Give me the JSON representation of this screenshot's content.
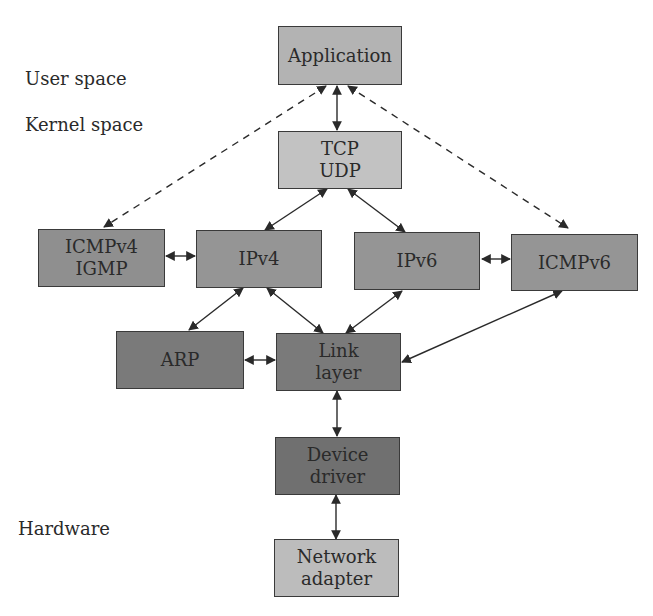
{
  "regions": {
    "user_space": "User space",
    "kernel_space": "Kernel space",
    "hardware": "Hardware"
  },
  "colors": {
    "light": "#bcbcbc",
    "medium": "#8e8e8e",
    "dark": "#767676",
    "stroke": "#2a2a2a"
  },
  "nodes": {
    "application": {
      "lines": [
        "Application"
      ]
    },
    "tcp_udp": {
      "lines": [
        "TCP",
        "UDP"
      ]
    },
    "icmpv4_igmp": {
      "lines": [
        "ICMPv4",
        "IGMP"
      ]
    },
    "ipv4": {
      "lines": [
        "IPv4"
      ]
    },
    "ipv6": {
      "lines": [
        "IPv6"
      ]
    },
    "icmpv6": {
      "lines": [
        "ICMPv6"
      ]
    },
    "arp": {
      "lines": [
        "ARP"
      ]
    },
    "link_layer": {
      "lines": [
        "Link",
        "layer"
      ]
    },
    "device_driver": {
      "lines": [
        "Device",
        "driver"
      ]
    },
    "network_adapter": {
      "lines": [
        "Network",
        "adapter"
      ]
    }
  },
  "edges": [
    {
      "from": "application",
      "to": "tcp_udp",
      "style": "solid",
      "bidirectional": true
    },
    {
      "from": "application",
      "to": "icmpv4_igmp",
      "style": "dashed",
      "bidirectional": false,
      "arrows_at": "both"
    },
    {
      "from": "application",
      "to": "icmpv6",
      "style": "dashed",
      "bidirectional": false,
      "arrows_at": "both"
    },
    {
      "from": "tcp_udp",
      "to": "ipv4",
      "style": "solid",
      "bidirectional": true
    },
    {
      "from": "tcp_udp",
      "to": "ipv6",
      "style": "solid",
      "bidirectional": true
    },
    {
      "from": "icmpv4_igmp",
      "to": "ipv4",
      "style": "solid",
      "bidirectional": true
    },
    {
      "from": "ipv6",
      "to": "icmpv6",
      "style": "solid",
      "bidirectional": true
    },
    {
      "from": "ipv4",
      "to": "arp",
      "style": "solid",
      "bidirectional": true
    },
    {
      "from": "ipv4",
      "to": "link_layer",
      "style": "solid",
      "bidirectional": true
    },
    {
      "from": "ipv6",
      "to": "link_layer",
      "style": "solid",
      "bidirectional": true
    },
    {
      "from": "icmpv6",
      "to": "link_layer",
      "style": "solid",
      "bidirectional": true
    },
    {
      "from": "arp",
      "to": "link_layer",
      "style": "solid",
      "bidirectional": true
    },
    {
      "from": "link_layer",
      "to": "device_driver",
      "style": "solid",
      "bidirectional": true
    },
    {
      "from": "device_driver",
      "to": "network_adapter",
      "style": "solid",
      "bidirectional": true
    }
  ]
}
